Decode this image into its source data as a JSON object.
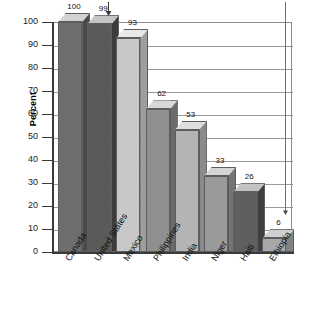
{
  "chart_data": {
    "type": "bar",
    "title": "",
    "xlabel": "",
    "ylabel": "Percent",
    "ylim": [
      0,
      100
    ],
    "ytick_step": 10,
    "grid": "horizontal",
    "legend": "none",
    "categories": [
      "Canada",
      "United States",
      "Mexico",
      "Philippines",
      "India",
      "Niger",
      "Haiti",
      "Ethiopia"
    ],
    "values": [
      100,
      99,
      93,
      62,
      53,
      33,
      26,
      6
    ],
    "value_labels": [
      "100",
      "99",
      "93",
      "62",
      "53",
      "33",
      "26",
      "6"
    ],
    "yticks": [
      "100",
      "90",
      "80",
      "70",
      "60",
      "50",
      "40",
      "30",
      "20",
      "10",
      "0"
    ],
    "bar_colors": [
      "#6e6e6e",
      "#5a5a5a",
      "#c8c8c8",
      "#8f8f8f",
      "#b4b4b4",
      "#9a9a9a",
      "#5f5f5f",
      "#a8a8a8"
    ],
    "bar_top_colors": [
      "#d2d2d2",
      "#c4c4c4",
      "#e8e8e8",
      "#d8d8d8",
      "#dedede",
      "#d4d4d4",
      "#c2c2c2",
      "#cfcfcf"
    ],
    "bar_side_colors": [
      "#4a4a4a",
      "#3c3c3c",
      "#9e9e9e",
      "#6a6a6a",
      "#8a8a8a",
      "#747474",
      "#3f3f3f",
      "#828282"
    ],
    "annotations": [
      {
        "name": "arrow-to-99",
        "target": "United States",
        "glyph": "down-arrow"
      },
      {
        "name": "leader-line-to-6",
        "target": "Ethiopia",
        "glyph": "down-arrow"
      }
    ]
  },
  "axis": {
    "y_title": "Percent"
  }
}
